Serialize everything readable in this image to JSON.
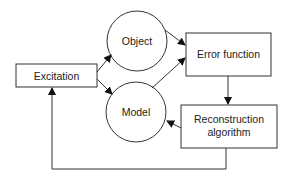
{
  "diagram": {
    "nodes": {
      "excitation": {
        "label": "Excitation",
        "shape": "rect"
      },
      "object": {
        "label": "Object",
        "shape": "circle"
      },
      "model": {
        "label": "Model",
        "shape": "circle"
      },
      "error_function": {
        "label": "Error function",
        "shape": "rect"
      },
      "reconstruction": {
        "label_line1": "Reconstruction",
        "label_line2": "algorithm",
        "shape": "rect"
      }
    },
    "edges": [
      {
        "from": "excitation",
        "to": "object"
      },
      {
        "from": "excitation",
        "to": "model"
      },
      {
        "from": "object",
        "to": "error_function"
      },
      {
        "from": "model",
        "to": "error_function"
      },
      {
        "from": "error_function",
        "to": "reconstruction"
      },
      {
        "from": "reconstruction",
        "to": "model"
      },
      {
        "from": "reconstruction",
        "to": "excitation"
      }
    ],
    "colors": {
      "stroke": "#333333",
      "background": "#ffffff",
      "text": "#222222"
    }
  }
}
